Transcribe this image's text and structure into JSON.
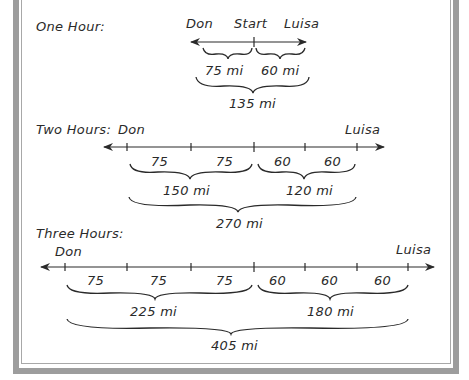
{
  "sections": [
    {
      "title": "One Hour:",
      "labels": {
        "left": "Don",
        "center": "Start",
        "right": "Luisa"
      },
      "segments": [],
      "subtotals": [
        "75 mi",
        "60 mi"
      ],
      "total": "135 mi"
    },
    {
      "title": "Two Hours:",
      "labels": {
        "left": "Don",
        "right": "Luisa"
      },
      "segments": [
        "75",
        "75",
        "60",
        "60"
      ],
      "subtotals": [
        "150 mi",
        "120 mi"
      ],
      "total": "270 mi"
    },
    {
      "title": "Three Hours:",
      "labels": {
        "left": "Don",
        "right": "Luisa"
      },
      "segments": [
        "75",
        "75",
        "75",
        "60",
        "60",
        "60"
      ],
      "subtotals": [
        "225 mi",
        "180 mi"
      ],
      "total": "405 mi"
    }
  ],
  "colors": {
    "ink": "#2a2a2a",
    "frame": "#9d9d9d"
  }
}
